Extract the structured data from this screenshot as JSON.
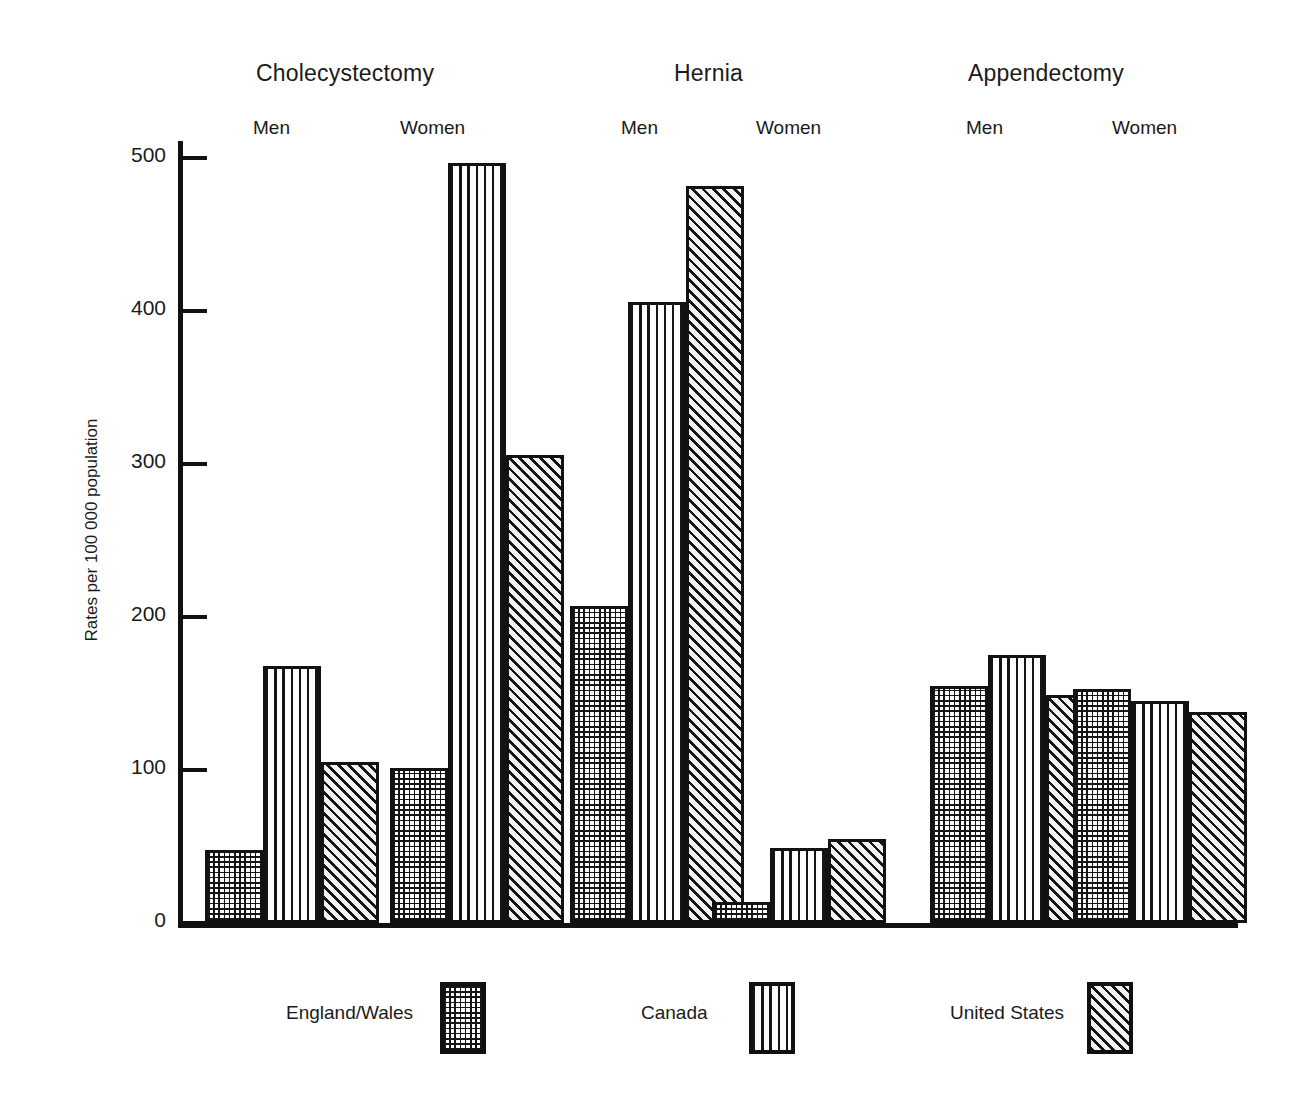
{
  "axis": {
    "y_title": "Rates per 100 000 population",
    "y_ticks": [
      "0",
      "100",
      "200",
      "300",
      "400",
      "500"
    ]
  },
  "groups": [
    {
      "title": "Cholecystectomy",
      "sexes": [
        "Men",
        "Women"
      ]
    },
    {
      "title": "Hernia",
      "sexes": [
        "Men",
        "Women"
      ]
    },
    {
      "title": "Appendectomy",
      "sexes": [
        "Men",
        "Women"
      ]
    }
  ],
  "legend": {
    "items": [
      {
        "label": "England/Wales",
        "pattern": "dotted-grid",
        "color": "#151515"
      },
      {
        "label": "Canada",
        "pattern": "wavy-vertical",
        "color": "#141414"
      },
      {
        "label": "United States",
        "pattern": "diagonal-hatch",
        "color": "#141414"
      }
    ]
  },
  "chart_data": {
    "type": "bar",
    "title": "",
    "xlabel": "",
    "ylabel": "Rates per 100 000 population",
    "ylim": [
      0,
      520
    ],
    "yticks": [
      0,
      100,
      200,
      300,
      400,
      500
    ],
    "grid": false,
    "legend_position": "bottom",
    "categories": [
      "Cholecystectomy Men",
      "Cholecystectomy Women",
      "Hernia Men",
      "Hernia Women",
      "Appendectomy Men",
      "Appendectomy Women"
    ],
    "series": [
      {
        "name": "England/Wales",
        "values": [
          48,
          101,
          207,
          14,
          155,
          153
        ]
      },
      {
        "name": "Canada",
        "values": [
          168,
          497,
          406,
          49,
          175,
          145
        ]
      },
      {
        "name": "United States",
        "values": [
          105,
          306,
          482,
          55,
          149,
          138
        ]
      }
    ]
  }
}
